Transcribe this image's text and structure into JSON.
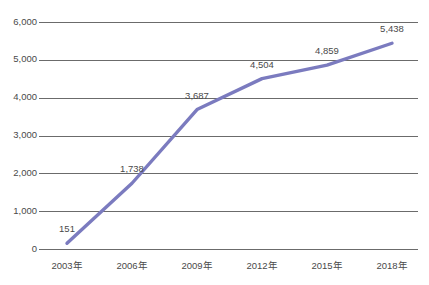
{
  "chart_data": {
    "type": "line",
    "title": "",
    "xlabel": "",
    "ylabel": "",
    "categories": [
      "2003年",
      "2006年",
      "2009年",
      "2012年",
      "2015年",
      "2018年"
    ],
    "values": [
      151,
      1738,
      3687,
      4504,
      4859,
      5438
    ],
    "point_labels": [
      "151",
      "1,738",
      "3,687",
      "4,504",
      "4,859",
      "5,438"
    ],
    "ylim": [
      0,
      6000
    ],
    "ytick_values": [
      0,
      1000,
      2000,
      3000,
      4000,
      5000,
      6000
    ],
    "ytick_labels": [
      "0",
      "1,000",
      "2,000",
      "3,000",
      "4,000",
      "5,000",
      "6,000"
    ],
    "grid": true,
    "legend": false,
    "series": [
      {
        "name": "series-1",
        "values": [
          151,
          1738,
          3687,
          4504,
          4859,
          5438
        ],
        "color": "#7b7bbf"
      }
    ],
    "colors": {
      "line": "#7b7bbf",
      "gridline": "#6b6b6b",
      "tick_text": "#4a4a4a",
      "background": "#ffffff"
    }
  },
  "geometry": {
    "plot_left": 45,
    "plot_right": 418,
    "plot_top": 22,
    "plot_bottom": 249,
    "first_x": 67,
    "last_x": 392,
    "ytick_label_x": 37,
    "ytick_tick_x1": 39,
    "ytick_tick_x2": 45,
    "xtick_label_y": 262,
    "point_label_dy": -11
  }
}
